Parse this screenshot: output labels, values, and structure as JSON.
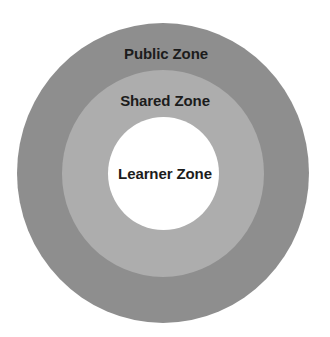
{
  "diagram": {
    "type": "concentric-circles",
    "colors": {
      "background": "#ffffff",
      "outer": "#8e8e8e",
      "middle": "#adadad",
      "inner": "#ffffff",
      "text": "#1c1c1c"
    },
    "zones": [
      {
        "id": "public",
        "label": "Public Zone",
        "level": "outer"
      },
      {
        "id": "shared",
        "label": "Shared Zone",
        "level": "middle"
      },
      {
        "id": "learner",
        "label": "Learner Zone",
        "level": "inner"
      }
    ]
  }
}
